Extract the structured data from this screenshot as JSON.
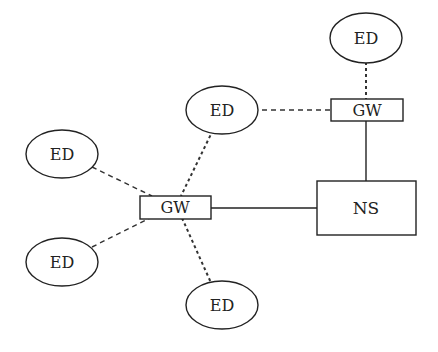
{
  "diagram": {
    "type": "network-topology",
    "nodes": {
      "ns": {
        "label": "NS"
      },
      "gw_top": {
        "label": "GW"
      },
      "gw_left": {
        "label": "GW"
      },
      "ed_top": {
        "label": "ED"
      },
      "ed_mid": {
        "label": "ED"
      },
      "ed_left_top": {
        "label": "ED"
      },
      "ed_left_bottom": {
        "label": "ED"
      },
      "ed_bottom": {
        "label": "ED"
      }
    },
    "edges": [
      {
        "from": "ed_top",
        "to": "gw_top",
        "style": "dotted"
      },
      {
        "from": "ed_mid",
        "to": "gw_top",
        "style": "dashed"
      },
      {
        "from": "gw_top",
        "to": "ns",
        "style": "solid"
      },
      {
        "from": "gw_left",
        "to": "ns",
        "style": "solid"
      },
      {
        "from": "ed_mid",
        "to": "gw_left",
        "style": "dotted"
      },
      {
        "from": "ed_left_top",
        "to": "gw_left",
        "style": "dashed"
      },
      {
        "from": "ed_left_bottom",
        "to": "gw_left",
        "style": "dashed"
      },
      {
        "from": "ed_bottom",
        "to": "gw_left",
        "style": "dotted"
      }
    ]
  }
}
